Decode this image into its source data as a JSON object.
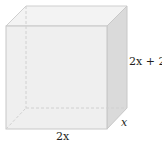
{
  "figure": {
    "type": "rectangular-prism",
    "labels": {
      "height": "2x + 2",
      "depth": "x",
      "width": "2x"
    },
    "colors": {
      "front_face": "#ececec",
      "top_face": "#f2f2f2",
      "side_face": "#d9d9d9",
      "edge": "#c8c8c8",
      "hidden_edge": "#d0d0d0",
      "label_text": "#231f20"
    }
  }
}
